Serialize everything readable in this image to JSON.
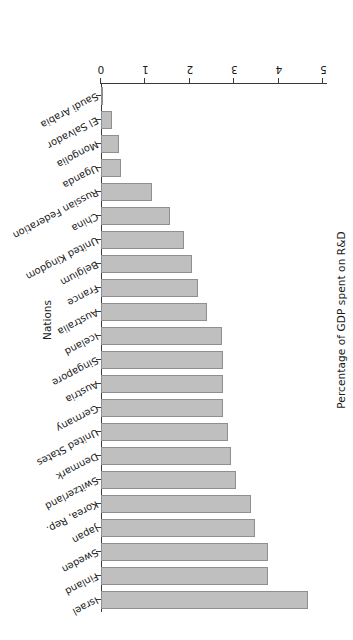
{
  "chart_data": {
    "type": "bar",
    "orientation": "vertical-bars-rotated-180",
    "title": "",
    "xlabel": "Nations",
    "ylabel": "Percentage of GDP spent on R&D",
    "ylim": [
      0,
      5
    ],
    "yticks": [
      "0",
      "1",
      "2",
      "3",
      "4",
      "5"
    ],
    "grid": false,
    "legend": null,
    "categories": [
      "Israel",
      "Finland",
      "Sweden",
      "Japan",
      "Korea, Rep.",
      "Switzerland",
      "Denmark",
      "United States",
      "Germany",
      "Austria",
      "Singapore",
      "Iceland",
      "Australia",
      "France",
      "Belgium",
      "United Kingdom",
      "China",
      "Russian Federation",
      "Uganda",
      "Mongolia",
      "El Salvador",
      "Saudi Arabia"
    ],
    "values": [
      4.65,
      3.75,
      3.75,
      3.47,
      3.37,
      3.03,
      2.92,
      2.85,
      2.75,
      2.74,
      2.74,
      2.72,
      2.38,
      2.18,
      2.05,
      1.87,
      1.55,
      1.15,
      0.45,
      0.4,
      0.25,
      0.05
    ]
  },
  "style": {
    "bar_fill": "#bfbfbf",
    "bar_stroke": "#8f8f8f",
    "axis_color": "#3a3a3a",
    "text_color": "#1a1a1a",
    "background": "#ffffff"
  }
}
